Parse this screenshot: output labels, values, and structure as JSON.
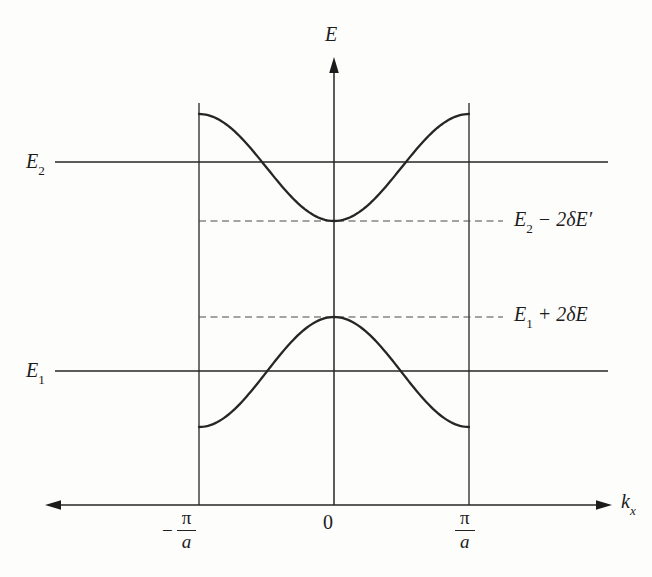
{
  "figure": {
    "background": "#fdfdfc",
    "line_color": "#262626",
    "dash_color": "#4a4a4a"
  },
  "labels": {
    "y_axis": "E",
    "x_axis_base": "k",
    "x_axis_sub": "x",
    "e2_base": "E",
    "e2_sub": "2",
    "e1_base": "E",
    "e1_sub": "1",
    "gap_top_base": "E",
    "gap_top_sub": "2",
    "gap_top_rest": " − 2δE′",
    "gap_bottom_base": "E",
    "gap_bottom_sub": "1",
    "gap_bottom_rest": " + 2δE",
    "tick_zero": "0",
    "tick_left_minus": "−",
    "tick_left_num": "π",
    "tick_left_den": "a",
    "tick_right_num": "π",
    "tick_right_den": "a"
  },
  "chart_data": {
    "type": "line",
    "xlabel": "kx",
    "ylabel": "E",
    "x_units": "π/a",
    "x_range": [
      -1,
      1
    ],
    "x_tick_labels": [
      "−π/a",
      "0",
      "π/a"
    ],
    "grid": false,
    "legend": "none",
    "zone_boundaries": [
      -1,
      1
    ],
    "series": [
      {
        "name": "upper band",
        "expression": "E2 − 2δE′·cos(kx·a)",
        "midline": 1.6875,
        "amplitude": -0.2675,
        "points": [
          [
            -1,
            1.955
          ],
          [
            -0.75,
            1.877
          ],
          [
            -0.5,
            1.688
          ],
          [
            -0.25,
            1.498
          ],
          [
            0,
            1.42
          ],
          [
            0.25,
            1.498
          ],
          [
            0.5,
            1.688
          ],
          [
            0.75,
            1.877
          ],
          [
            1,
            1.955
          ]
        ]
      },
      {
        "name": "lower band",
        "expression": "E1 + 2δE·cos(kx·a)",
        "midline": 0.665,
        "amplitude": 0.275,
        "points": [
          [
            -1,
            0.39
          ],
          [
            -0.75,
            0.471
          ],
          [
            -0.5,
            0.665
          ],
          [
            -0.25,
            0.86
          ],
          [
            0,
            0.94
          ],
          [
            0.25,
            0.86
          ],
          [
            0.5,
            0.665
          ],
          [
            0.75,
            0.471
          ],
          [
            1,
            0.39
          ]
        ]
      }
    ],
    "reference_lines": [
      {
        "label": "E2",
        "value": 1.715,
        "style": "solid"
      },
      {
        "label": "E2 − 2δE′",
        "value": 1.42,
        "style": "dashed"
      },
      {
        "label": "E1 + 2δE",
        "value": 0.94,
        "style": "dashed"
      },
      {
        "label": "E1",
        "value": 0.67,
        "style": "solid"
      }
    ]
  }
}
